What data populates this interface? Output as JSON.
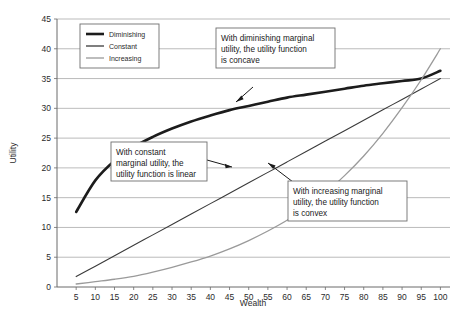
{
  "chart_data": {
    "type": "line",
    "title": "",
    "xlabel": "Wealth",
    "ylabel": "Utility",
    "xlim": [
      0,
      102.5
    ],
    "ylim": [
      0,
      45
    ],
    "grid": true,
    "legend_position": "top-left",
    "xticks": [
      5,
      10,
      15,
      20,
      25,
      30,
      35,
      40,
      45,
      50,
      55,
      60,
      65,
      70,
      75,
      80,
      85,
      90,
      95,
      100
    ],
    "yticks": [
      0,
      5,
      10,
      15,
      20,
      25,
      30,
      35,
      40,
      45
    ],
    "x": [
      5,
      10,
      15,
      20,
      25,
      30,
      35,
      40,
      45,
      50,
      55,
      60,
      65,
      70,
      75,
      80,
      85,
      90,
      95,
      100
    ],
    "series": [
      {
        "name": "Diminishing",
        "color": "#1c1c1c",
        "width": 2.6,
        "values": [
          12.6,
          17.9,
          21.2,
          23.5,
          25.2,
          26.6,
          27.8,
          28.8,
          29.7,
          30.4,
          31.1,
          31.8,
          32.3,
          32.8,
          33.3,
          33.8,
          34.2,
          34.6,
          35.0,
          36.3
        ]
      },
      {
        "name": "Constant",
        "color": "#3a3a3a",
        "width": 1.1,
        "values": [
          1.75,
          3.5,
          5.25,
          7.0,
          8.75,
          10.5,
          12.25,
          14.0,
          15.75,
          17.5,
          19.25,
          21.0,
          22.75,
          24.5,
          26.25,
          28.0,
          29.75,
          31.5,
          33.25,
          35.0
        ]
      },
      {
        "name": "Increasing",
        "color": "#9a9a9a",
        "width": 1.3,
        "values": [
          0.5,
          0.9,
          1.3,
          1.8,
          2.5,
          3.3,
          4.2,
          5.2,
          6.4,
          7.8,
          9.4,
          11.2,
          13.3,
          15.8,
          18.7,
          22.0,
          25.8,
          30.1,
          34.8,
          40.0
        ]
      }
    ],
    "annotations": [
      {
        "id": "concave-note",
        "lines": [
          "With diminishing marginal",
          "utility, the utility function",
          "is concave"
        ]
      },
      {
        "id": "linear-note",
        "lines": [
          "With constant",
          "marginal utility, the",
          "utility function is linear"
        ]
      },
      {
        "id": "convex-note",
        "lines": [
          "With increasing marginal",
          "utility, the utility function",
          "is convex"
        ]
      }
    ]
  },
  "legend": {
    "items": [
      {
        "label": "Diminishing"
      },
      {
        "label": "Constant"
      },
      {
        "label": "Increasing"
      }
    ]
  },
  "axes": {
    "x_title": "Wealth",
    "y_title": "Utility"
  }
}
